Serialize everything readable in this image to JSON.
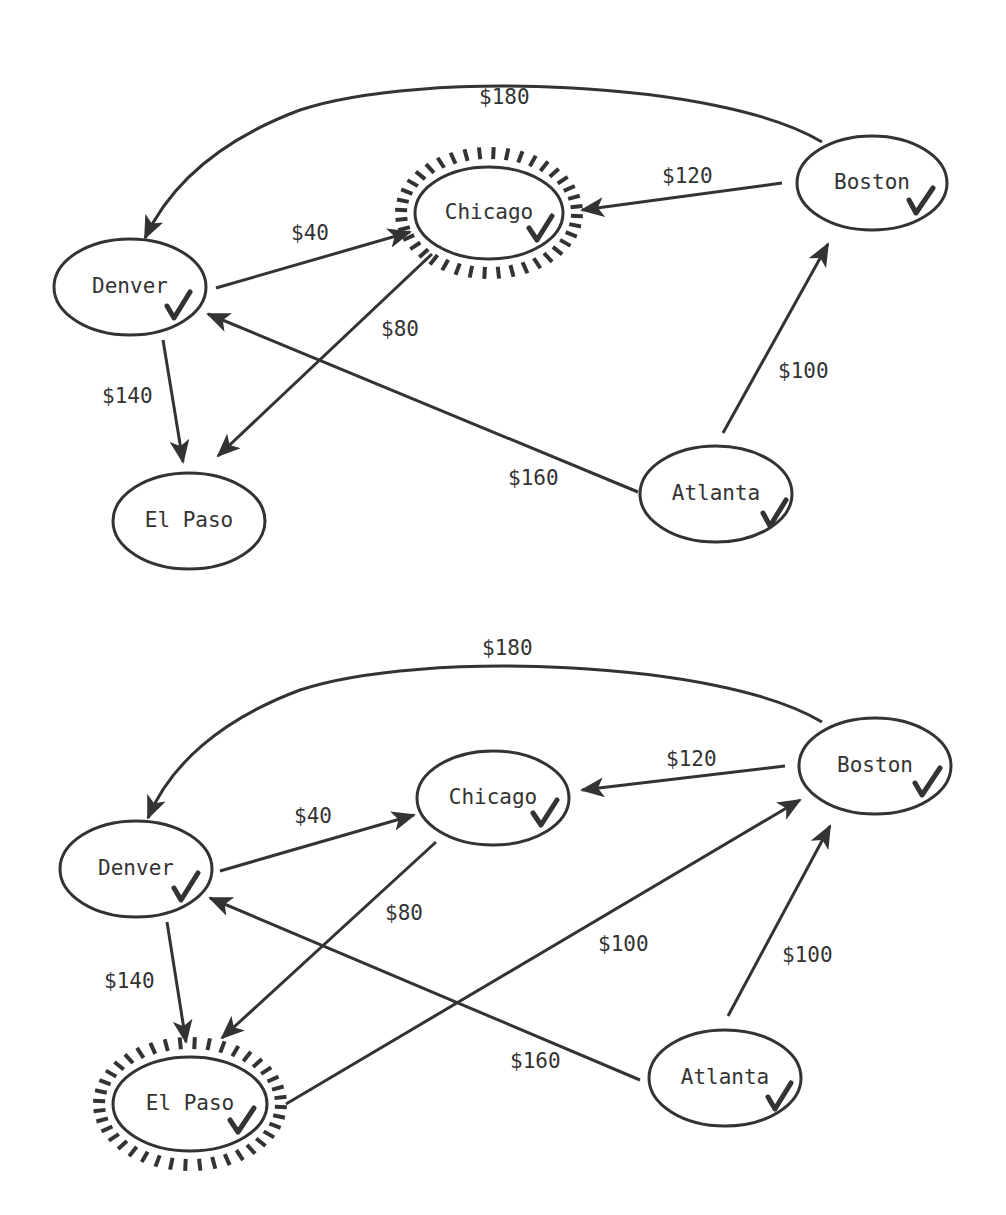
{
  "diagrams": [
    {
      "id": "top",
      "highlighted_node": "Chicago",
      "nodes": [
        {
          "name": "Denver",
          "label": "Denver",
          "visited": true
        },
        {
          "name": "Chicago",
          "label": "Chicago",
          "visited": true
        },
        {
          "name": "Boston",
          "label": "Boston",
          "visited": true
        },
        {
          "name": "El Paso",
          "label": "El Paso",
          "visited": false
        },
        {
          "name": "Atlanta",
          "label": "Atlanta",
          "visited": true
        }
      ],
      "edges": [
        {
          "from": "Boston",
          "to": "Denver",
          "cost": "$180"
        },
        {
          "from": "Boston",
          "to": "Chicago",
          "cost": "$120"
        },
        {
          "from": "Denver",
          "to": "Chicago",
          "cost": "$40"
        },
        {
          "from": "Chicago",
          "to": "El Paso",
          "cost": "$80"
        },
        {
          "from": "Denver",
          "to": "El Paso",
          "cost": "$140"
        },
        {
          "from": "Atlanta",
          "to": "Denver",
          "cost": "$160"
        },
        {
          "from": "Atlanta",
          "to": "Boston",
          "cost": "$100"
        }
      ]
    },
    {
      "id": "bottom",
      "highlighted_node": "El Paso",
      "nodes": [
        {
          "name": "Denver",
          "label": "Denver",
          "visited": true
        },
        {
          "name": "Chicago",
          "label": "Chicago",
          "visited": true
        },
        {
          "name": "Boston",
          "label": "Boston",
          "visited": true
        },
        {
          "name": "El Paso",
          "label": "El Paso",
          "visited": true
        },
        {
          "name": "Atlanta",
          "label": "Atlanta",
          "visited": true
        }
      ],
      "edges": [
        {
          "from": "Boston",
          "to": "Denver",
          "cost": "$180"
        },
        {
          "from": "Boston",
          "to": "Chicago",
          "cost": "$120"
        },
        {
          "from": "Denver",
          "to": "Chicago",
          "cost": "$40"
        },
        {
          "from": "Chicago",
          "to": "El Paso",
          "cost": "$80"
        },
        {
          "from": "Denver",
          "to": "El Paso",
          "cost": "$140"
        },
        {
          "from": "Atlanta",
          "to": "Denver",
          "cost": "$160"
        },
        {
          "from": "Atlanta",
          "to": "Boston",
          "cost": "$100"
        },
        {
          "from": "El Paso",
          "to": "Boston",
          "cost": "$100"
        }
      ]
    }
  ],
  "colors": {
    "stroke": "#333333",
    "background": "#ffffff"
  }
}
